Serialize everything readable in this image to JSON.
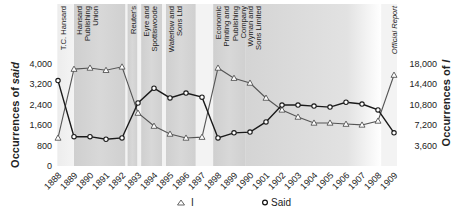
{
  "chart_data": {
    "type": "line",
    "title": "",
    "xlabel": "",
    "ylabel_left": "Occurrences of said",
    "ylabel_right": "Occurrences of I",
    "ylim_left": [
      0,
      4000
    ],
    "ylim_right": [
      0,
      18000
    ],
    "yticks_left": [
      "0",
      "800",
      "1,600",
      "2,400",
      "3,200",
      "4,000"
    ],
    "yticks_left_values": [
      0,
      800,
      1600,
      2400,
      3200,
      4000
    ],
    "yticks_right": [
      "3,600",
      "7,200",
      "10,800",
      "14,400",
      "18,000"
    ],
    "yticks_right_values": [
      3600,
      7200,
      10800,
      14400,
      18000
    ],
    "x": [
      "1888",
      "1889",
      "1890",
      "1891",
      "1892",
      "1893",
      "1894",
      "1895",
      "1896",
      "1897",
      "1898",
      "1899",
      "1990",
      "1901",
      "1902",
      "1903",
      "1904",
      "1905",
      "1906",
      "1907",
      "1908",
      "1909"
    ],
    "series": [
      {
        "name": "I",
        "axis": "right",
        "marker": "triangle",
        "color": "#555555",
        "values": [
          4950,
          17100,
          17300,
          16900,
          17500,
          9350,
          7050,
          5650,
          4950,
          5100,
          17300,
          15500,
          14650,
          12000,
          9900,
          8650,
          7600,
          7600,
          7400,
          7250,
          7950,
          16050
        ]
      },
      {
        "name": "Said",
        "axis": "left",
        "marker": "circle",
        "color": "#1a1a1a",
        "values": [
          3350,
          1150,
          1150,
          1050,
          1100,
          2470,
          3050,
          2670,
          2860,
          2700,
          1100,
          1300,
          1330,
          1730,
          2390,
          2390,
          2350,
          2310,
          2500,
          2430,
          2200,
          1300
        ]
      }
    ],
    "bands": [
      {
        "label": [
          "T.C. Hansard"
        ],
        "start": 1888,
        "end": 1889,
        "shade": "light"
      },
      {
        "label": [
          "Hansard",
          "Publishing",
          "Union"
        ],
        "start": 1889,
        "end": 1892.2,
        "shade": "dark"
      },
      {
        "label": [
          "Reuter's"
        ],
        "start": 1892.35,
        "end": 1892.95,
        "shade": "dark"
      },
      {
        "label": [
          "Eyre and",
          "Spottiswoode"
        ],
        "start": 1893.2,
        "end": 1894.5,
        "shade": "dark"
      },
      {
        "label": [
          "Waterlow and",
          "Sons Ltd"
        ],
        "start": 1894.75,
        "end": 1896.6,
        "shade": "dark"
      },
      {
        "label": [
          "Economic",
          "Printing and",
          "Publishing",
          "Company"
        ],
        "start": 1897.7,
        "end": 1899.7,
        "shade": "dark"
      },
      {
        "label": [
          "Wyman and",
          "Sons Limited"
        ],
        "start": 1899.7,
        "end": 1908.2,
        "shade": "dark",
        "fade": true
      }
    ],
    "annotations": [
      {
        "text": "Official Report",
        "x": 1909,
        "italic": true
      }
    ],
    "legend": {
      "position": "bottom",
      "entries": [
        {
          "label": "I",
          "marker": "triangle"
        },
        {
          "label": "Said",
          "marker": "circle"
        }
      ]
    },
    "grid": false
  }
}
